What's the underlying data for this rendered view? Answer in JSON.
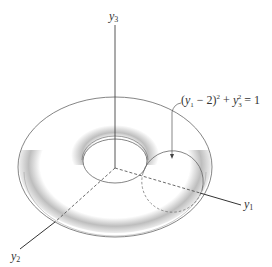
{
  "figure": {
    "type": "torus-diagram",
    "axes": [
      {
        "id": "y1",
        "label": "y",
        "subscript": "1"
      },
      {
        "id": "y2",
        "label": "y",
        "subscript": "2"
      },
      {
        "id": "y3",
        "label": "y",
        "subscript": "3"
      }
    ],
    "annotation": {
      "equation": "(y₁ − 2)² + y₃² = 1",
      "parts": {
        "open": "(",
        "var1": "y",
        "sub1": "1",
        "minus": " − 2)",
        "sq1": "2",
        "plus": " + ",
        "var2": "y",
        "sub2": "3",
        "sq2": "2",
        "rhs": " = 1"
      }
    },
    "colors": {
      "line": "#555555",
      "shading": "#9a9a9a",
      "text": "#333333"
    }
  }
}
